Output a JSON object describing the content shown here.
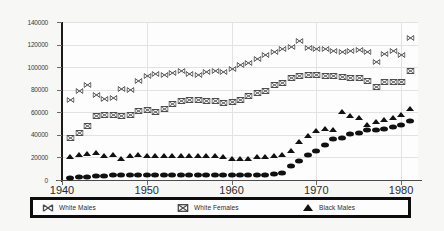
{
  "chart_data": {
    "type": "scatter",
    "title": "",
    "subtitle": "",
    "xlabel": "",
    "ylabel": "",
    "xlim": [
      1940,
      1982
    ],
    "ylim": [
      0,
      140000
    ],
    "grid": true,
    "legend_position": "bottom",
    "xticks": [
      "1940",
      "1950",
      "1960",
      "1970",
      "1980"
    ],
    "xtick_values": [
      1940,
      1950,
      1960,
      1970,
      1980
    ],
    "yticks": [
      "0",
      "20000",
      "40000",
      "60000",
      "80000",
      "100000",
      "120000",
      "140000"
    ],
    "ytick_values": [
      0,
      20000,
      40000,
      60000,
      80000,
      100000,
      120000,
      140000
    ],
    "x": [
      1941,
      1942,
      1943,
      1944,
      1945,
      1946,
      1947,
      1948,
      1949,
      1950,
      1951,
      1952,
      1953,
      1954,
      1955,
      1956,
      1957,
      1958,
      1959,
      1960,
      1961,
      1962,
      1963,
      1964,
      1965,
      1966,
      1967,
      1968,
      1969,
      1970,
      1971,
      1972,
      1973,
      1974,
      1975,
      1976,
      1977,
      1978,
      1979,
      1980,
      1981
    ],
    "series": [
      {
        "name": "White Males",
        "marker": "x-bowtie",
        "style": "hollow",
        "values": [
          71000,
          79000,
          84000,
          75000,
          72000,
          73000,
          81000,
          80000,
          88000,
          92000,
          94000,
          93000,
          95000,
          97000,
          94000,
          93000,
          96000,
          97000,
          96000,
          98000,
          102000,
          104000,
          107000,
          111000,
          113000,
          116000,
          118000,
          123000,
          117000,
          116000,
          116000,
          114000,
          113000,
          114000,
          115000,
          113000,
          105000,
          112000,
          114000,
          111000,
          126000
        ]
      },
      {
        "name": "White Females",
        "marker": "bowtie-box",
        "style": "hollow",
        "values": [
          37000,
          42000,
          48000,
          57000,
          58000,
          58000,
          57000,
          58000,
          61000,
          62000,
          60000,
          63000,
          67000,
          70000,
          71000,
          71000,
          70000,
          70000,
          68000,
          69000,
          71000,
          74000,
          77000,
          79000,
          84000,
          86000,
          90000,
          92000,
          93000,
          93000,
          92000,
          92000,
          91000,
          90000,
          90000,
          88000,
          82000,
          87000,
          87000,
          87000,
          97000
        ]
      },
      {
        "name": "Black Males",
        "marker": "triangle",
        "style": "filled",
        "values": [
          20000,
          22000,
          23000,
          24000,
          21000,
          22000,
          19000,
          21000,
          22000,
          21000,
          21000,
          21000,
          21000,
          21000,
          21000,
          21000,
          21000,
          21000,
          20000,
          19000,
          19000,
          19000,
          20000,
          20000,
          21000,
          22000,
          26000,
          34000,
          39000,
          43000,
          45000,
          44000,
          60000,
          57000,
          55000,
          49000,
          51000,
          53000,
          55000,
          58000,
          63000
        ]
      },
      {
        "name": "Black Females",
        "marker": "ellipse",
        "style": "filled",
        "values": [
          2000,
          2500,
          3000,
          3500,
          3800,
          4000,
          4200,
          4000,
          4000,
          4000,
          4000,
          4000,
          4000,
          4000,
          4000,
          4000,
          4000,
          4000,
          4000,
          4000,
          4000,
          4000,
          4500,
          4800,
          5000,
          6000,
          12000,
          17000,
          22000,
          26000,
          31000,
          36000,
          37000,
          41000,
          42000,
          44000,
          44000,
          45000,
          47000,
          49000,
          52000
        ]
      }
    ],
    "legend": [
      {
        "label": "White Males",
        "marker": "x-bowtie-icon"
      },
      {
        "label": "White Females",
        "marker": "bowtie-box-icon"
      },
      {
        "label": "Black Males",
        "marker": "triangle-icon"
      }
    ],
    "colors": {
      "marker_outline": "#555555",
      "marker_fill": "#111111",
      "grid": "#e2e2e0",
      "axis": "#1a1a1a",
      "legend_border": "#0d0d0d",
      "background": "#ffffff"
    }
  }
}
